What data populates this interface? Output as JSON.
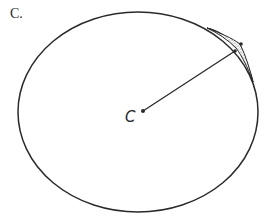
{
  "figure": {
    "panel_label": "C.",
    "center_label": "C",
    "colors": {
      "stroke": "#2a2a2a",
      "background": "#ffffff",
      "stipple": "#555555"
    },
    "ellipse": {
      "cx": 138,
      "cy": 112,
      "rx": 120,
      "ry": 100
    },
    "center_point": {
      "x": 143,
      "y": 111
    },
    "radius_end": {
      "x": 235,
      "y": 52
    }
  }
}
